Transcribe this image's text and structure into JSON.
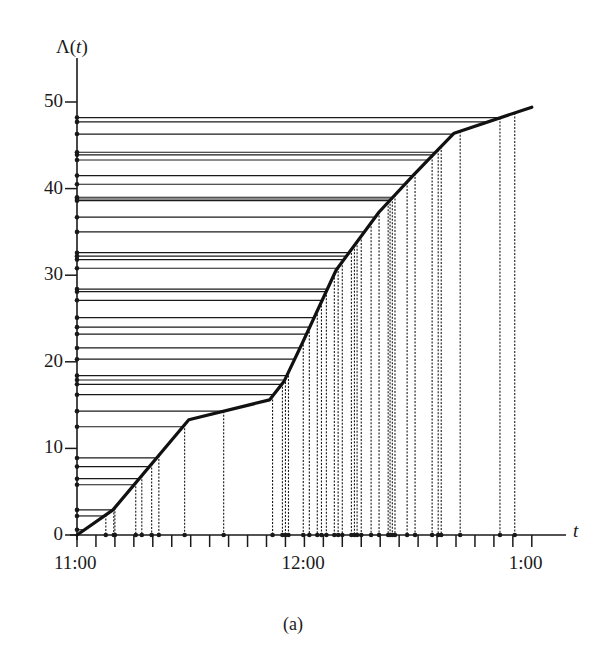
{
  "chart_data": {
    "type": "line",
    "title": "",
    "caption": "(a)",
    "xlabel": "t",
    "ylabel": "Λ(t)",
    "ylabel_parts": {
      "prefix": "Λ(",
      "var": "t",
      "suffix": ")"
    },
    "xlim_minutes_after_11": [
      0,
      120
    ],
    "ylim": [
      0,
      50
    ],
    "x_ticks": {
      "minor_step_minutes": 5,
      "labeled": [
        {
          "minutes": 0,
          "label": "11:00"
        },
        {
          "minutes": 60,
          "label": "12:00"
        },
        {
          "minutes": 120,
          "label": "1:00"
        }
      ]
    },
    "y_ticks": [
      0,
      10,
      20,
      30,
      40,
      50
    ],
    "grid": false,
    "legend": null,
    "series": [
      {
        "name": "cumulative intensity Λ(t)",
        "style": "thick solid piecewise-linear",
        "x_minutes": [
          0,
          9.5,
          29.5,
          50.8,
          54.7,
          59.5,
          68.4,
          79.7,
          88.9,
          99.5,
          120
        ],
        "y": [
          0,
          2.9,
          13.3,
          15.6,
          17.8,
          22.2,
          30.6,
          37.3,
          41.6,
          46.4,
          49.4
        ]
      }
    ],
    "event_levels_lambda": [
      0.6,
      2.2,
      2.9,
      5.8,
      6.5,
      7.9,
      8.9,
      12.5,
      14.3,
      16.2,
      17.4,
      17.9,
      18.4,
      20.3,
      21.6,
      23.2,
      24.0,
      25.1,
      27.1,
      28.1,
      28.4,
      30.8,
      31.8,
      32.2,
      32.6,
      35.0,
      36.7,
      38.6,
      38.8,
      39.0,
      40.5,
      41.5,
      43.3,
      43.9,
      44.2,
      46.3,
      47.7,
      48.2
    ],
    "event_times_minutes": [
      7.6,
      9.7,
      10.0,
      15.5,
      17.1,
      19.7,
      21.6,
      28.4,
      38.7,
      51.6,
      54.2,
      55.0,
      55.8,
      59.7,
      61.3,
      63.4,
      64.5,
      65.8,
      67.9,
      68.9,
      70.0,
      72.4,
      73.2,
      73.9,
      75.0,
      77.6,
      79.7,
      82.1,
      82.6,
      83.2,
      83.9,
      87.1,
      89.2,
      93.7,
      95.3,
      96.1,
      101.1,
      111.6,
      115.5
    ],
    "annotations": [
      "horizontal lines from y-axis at each event level to the curve",
      "vertical dotted lines from the curve down to event times on the t-axis"
    ]
  },
  "colors": {
    "ink": "#1a1a1a",
    "background": "#ffffff"
  }
}
